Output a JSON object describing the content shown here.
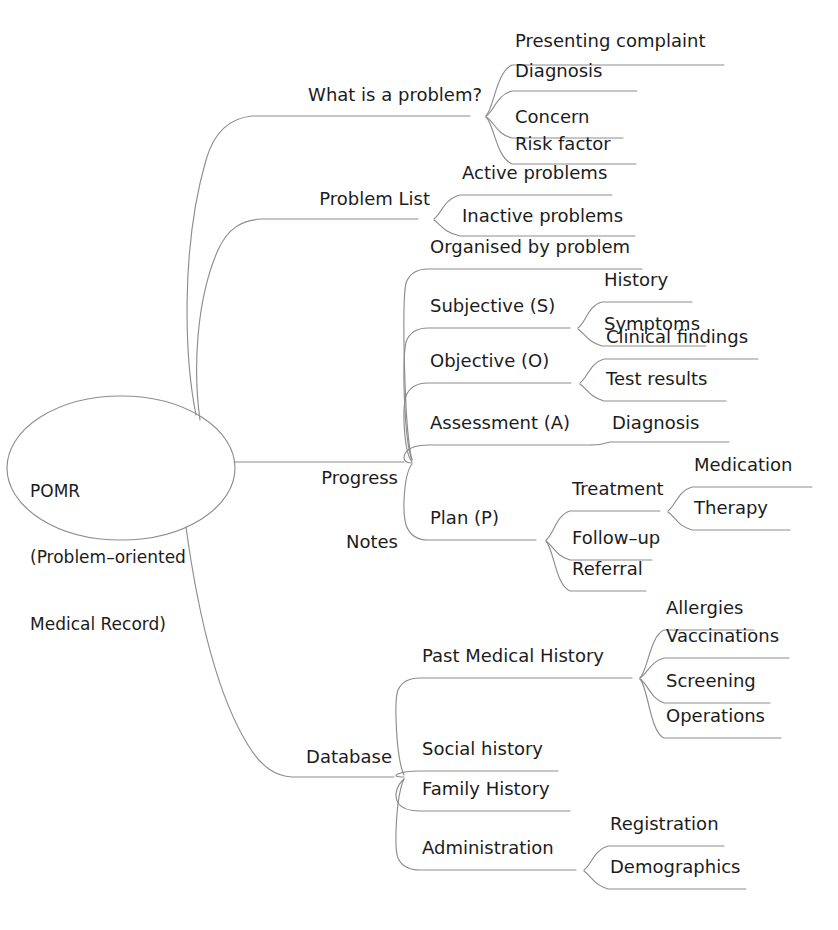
{
  "diagram": {
    "type": "mind-map",
    "orientation": "left-to-right",
    "colors": {
      "background": "#ffffff",
      "text": "#1c1c1c",
      "branch_line": "#8d8d8d",
      "root_outline": "#8d8d8d"
    }
  },
  "root": {
    "id": "pomr",
    "line1": "POMR",
    "line2": "(Problem–oriented",
    "line3": "Medical Record)",
    "shape": "ellipse"
  },
  "branches": [
    {
      "id": "what-is-a-problem",
      "label": "What is a problem?",
      "children": [
        {
          "id": "presenting-complaint",
          "label": "Presenting complaint"
        },
        {
          "id": "diagnosis-problem",
          "label": "Diagnosis"
        },
        {
          "id": "concern",
          "label": "Concern"
        },
        {
          "id": "risk-factor",
          "label": "Risk factor"
        }
      ]
    },
    {
      "id": "problem-list",
      "label": "Problem List",
      "children": [
        {
          "id": "active-problems",
          "label": "Active problems"
        },
        {
          "id": "inactive-problems",
          "label": "Inactive problems"
        }
      ]
    },
    {
      "id": "progress-notes",
      "label": "Progress\nNotes",
      "label_line1": "Progress",
      "label_line2": "Notes",
      "children": [
        {
          "id": "organised-by-problem",
          "label": "Organised by problem",
          "children": []
        },
        {
          "id": "subjective",
          "label": "Subjective (S)",
          "children": [
            {
              "id": "history",
              "label": "History"
            },
            {
              "id": "symptoms",
              "label": "Symptoms"
            }
          ]
        },
        {
          "id": "objective",
          "label": "Objective (O)",
          "children": [
            {
              "id": "clinical-findings",
              "label": "Clinical findings"
            },
            {
              "id": "test-results",
              "label": "Test results"
            }
          ]
        },
        {
          "id": "assessment",
          "label": "Assessment (A)",
          "children": [
            {
              "id": "diagnosis-assessment",
              "label": "Diagnosis"
            }
          ]
        },
        {
          "id": "plan",
          "label": "Plan (P)",
          "children": [
            {
              "id": "treatment",
              "label": "Treatment",
              "children": [
                {
                  "id": "medication",
                  "label": "Medication"
                },
                {
                  "id": "therapy",
                  "label": "Therapy"
                }
              ]
            },
            {
              "id": "follow-up",
              "label": "Follow–up",
              "children": []
            },
            {
              "id": "referral",
              "label": "Referral",
              "children": []
            }
          ]
        }
      ]
    },
    {
      "id": "database",
      "label": "Database",
      "children": [
        {
          "id": "past-medical-history",
          "label": "Past Medical History",
          "children": [
            {
              "id": "allergies",
              "label": "Allergies"
            },
            {
              "id": "vaccinations",
              "label": "Vaccinations"
            },
            {
              "id": "screening",
              "label": "Screening"
            },
            {
              "id": "operations",
              "label": "Operations"
            }
          ]
        },
        {
          "id": "social-history",
          "label": "Social history",
          "children": []
        },
        {
          "id": "family-history",
          "label": "Family History",
          "children": []
        },
        {
          "id": "administration",
          "label": "Administration",
          "children": [
            {
              "id": "registration",
              "label": "Registration"
            },
            {
              "id": "demographics",
              "label": "Demographics"
            }
          ]
        }
      ]
    }
  ]
}
